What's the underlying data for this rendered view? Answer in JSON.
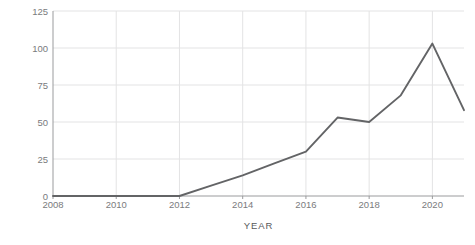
{
  "chart_data": {
    "type": "line",
    "title": "",
    "xlabel": "YEAR",
    "ylabel": "Number of publications",
    "x": [
      2008,
      2009,
      2010,
      2011,
      2012,
      2013,
      2014,
      2015,
      2016,
      2017,
      2018,
      2019,
      2020,
      2021
    ],
    "values": [
      0,
      0,
      0,
      0,
      0,
      7,
      14,
      22,
      30,
      53,
      50,
      68,
      103,
      58
    ],
    "series": [
      {
        "name": "Number of publications",
        "values": [
          0,
          0,
          0,
          0,
          0,
          7,
          14,
          22,
          30,
          53,
          50,
          68,
          103,
          58
        ]
      }
    ],
    "xlim": [
      2008,
      2021
    ],
    "ylim": [
      0,
      125
    ],
    "y_ticks": [
      0,
      25,
      50,
      75,
      100,
      125
    ],
    "y_tick_labels": [
      "0",
      "25",
      "50",
      "75",
      "100",
      "125"
    ],
    "x_ticks": [
      2008,
      2010,
      2012,
      2014,
      2016,
      2018,
      2020
    ],
    "x_tick_labels": [
      "2008",
      "2010",
      "2012",
      "2014",
      "2016",
      "2018",
      "2020"
    ],
    "grid": true,
    "legend": "none",
    "line_color": "#636466",
    "grid_color": "#e3e3e4",
    "axis_color": "#9a9b9d",
    "text_color": "#58595b",
    "background": "#ffffff"
  }
}
